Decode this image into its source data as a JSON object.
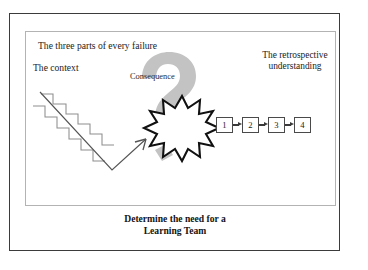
{
  "figure": {
    "name": "three-parts-of-every-failure-diagram",
    "heading": "The three parts of every failure",
    "caption_line1": "Determine the need for a",
    "caption_line2": "Learning Team",
    "parts": {
      "context_label": "The context",
      "consequence_label": "Consequence",
      "retrospective_label": "The retrospective understanding"
    },
    "steps": [
      {
        "label": "1"
      },
      {
        "label": "2"
      },
      {
        "label": "3"
      },
      {
        "label": "4"
      }
    ],
    "colors": {
      "outer_frame": "#3b3b3b",
      "inner_panel_border": "#b3b3b3",
      "question_mark_gray": "#c3c3c3",
      "starburst_outline": "#111111",
      "starburst_fill": "#ffffff",
      "staircase_line": "#8e8e8e",
      "arrow_line": "#555555",
      "text": "#1c1c1c"
    }
  }
}
